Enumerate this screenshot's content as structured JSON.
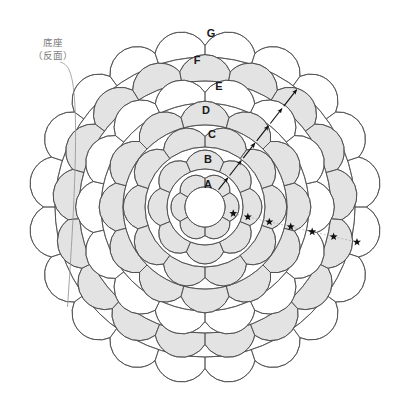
{
  "header": {
    "faded_text": ""
  },
  "callout": {
    "name": "base-callout",
    "line1": "底座",
    "line2": "（反面）"
  },
  "diagram": {
    "center": {
      "x": 205,
      "y": 207
    },
    "core_radius": 20,
    "core_fill": "#ffffff",
    "stroke_color": "#4a4a4a",
    "shade_fill": "#e3e3e3",
    "plain_fill": "#ffffff",
    "marker_colors": {
      "arrow": "#111111",
      "star": "#111111",
      "leader": "#9a9a9a"
    },
    "rings": [
      {
        "label": "A",
        "radius": 38,
        "petals": 6,
        "fill": "shade",
        "letter_x": 208,
        "letter_y": 184
      },
      {
        "label": "B",
        "radius": 60,
        "petals": 8,
        "fill": "shade",
        "letter_x": 208,
        "letter_y": 159
      },
      {
        "label": "C",
        "radius": 82,
        "petals": 10,
        "fill": "shade",
        "letter_x": 212,
        "letter_y": 134
      },
      {
        "label": "D",
        "radius": 104,
        "petals": 12,
        "fill": "shade",
        "letter_x": 206,
        "letter_y": 110
      },
      {
        "label": "E",
        "radius": 126,
        "petals": 14,
        "fill": "plain",
        "letter_x": 219,
        "letter_y": 86
      },
      {
        "label": "F",
        "radius": 150,
        "petals": 17,
        "fill": "shade",
        "letter_x": 197,
        "letter_y": 60
      },
      {
        "label": "G",
        "radius": 174,
        "petals": 20,
        "fill": "plain",
        "letter_x": 211,
        "letter_y": 33
      }
    ],
    "arrows": {
      "count": 6,
      "direction": "outward",
      "angle_deg": -52
    },
    "stars": {
      "count": 7,
      "placement": "radial-line-lower-right",
      "angle_deg": 13
    }
  }
}
